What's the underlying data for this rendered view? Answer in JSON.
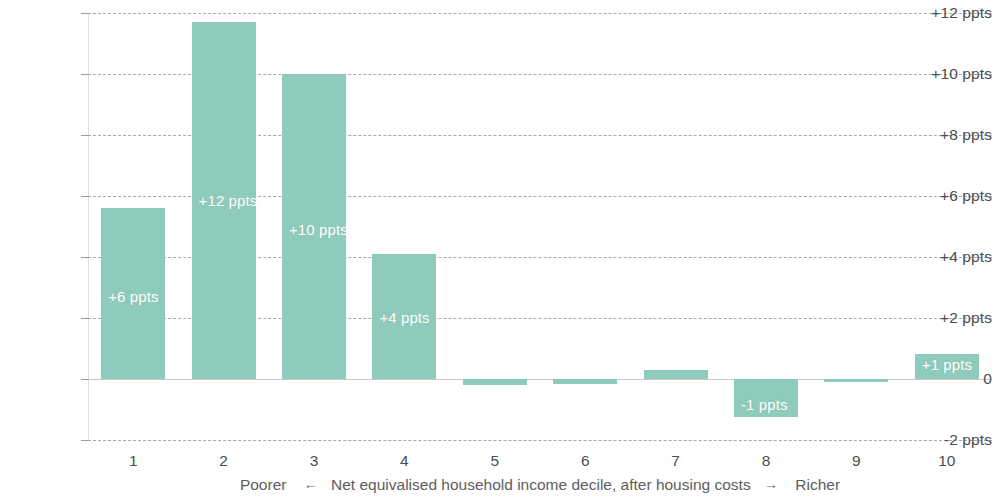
{
  "chart_data": {
    "type": "bar",
    "title": "",
    "subtitle": "",
    "xlabel_parts": {
      "left": "Poorer",
      "left_arrow": "←",
      "middle": "Net equivalised household income decile, after housing costs",
      "right_arrow": "→",
      "right": "Richer"
    },
    "xlabel": "Poorer ← Net equivalised household income decile, after housing costs → Richer",
    "ylabel": "",
    "categories": [
      "1",
      "2",
      "3",
      "4",
      "5",
      "6",
      "7",
      "8",
      "9",
      "10"
    ],
    "values": [
      5.6,
      11.7,
      10.0,
      4.1,
      -0.2,
      -0.15,
      0.3,
      -1.2,
      -0.1,
      0.85
    ],
    "data_labels": [
      "+6 ppts",
      "+12 ppts",
      "+10 ppts",
      "+4 ppts",
      "",
      "",
      "",
      "-1 ppts",
      "",
      "+1 ppts"
    ],
    "ylim": [
      -2,
      12
    ],
    "yticks": [
      12,
      10,
      8,
      6,
      4,
      2,
      0,
      -2
    ],
    "ytick_labels": [
      "+12 ppts",
      "+10 ppts",
      "+8 ppts",
      "+6 ppts",
      "+4 ppts",
      "+2 ppts",
      "0",
      "-2 ppts"
    ],
    "grid": true,
    "grid_style": "dashed-horizontal",
    "legend": null,
    "bar_color": "#8ecbbc",
    "bar_label_color": "#ffffff",
    "grid_color": "#9b9b9b",
    "zero_line_color": "#cfc6c6",
    "axis_text_color": "#4d4d4d"
  }
}
